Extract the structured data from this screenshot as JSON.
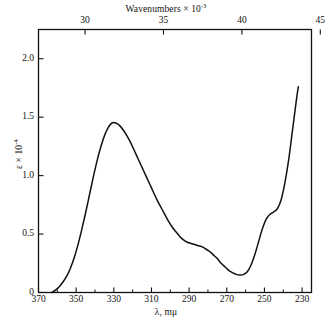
{
  "chart_data": {
    "type": "line",
    "title": "",
    "xlabel": "λ, mμ",
    "ylabel": "ε × 10",
    "ylabel_exp": "-4",
    "top_xlabel": "Wavenumbers × 10",
    "top_xlabel_exp": "-3",
    "xlim": [
      370,
      225
    ],
    "ylim": [
      0,
      2.25
    ],
    "top_xlim": [
      27.03,
      44.44
    ],
    "x_ticks": [
      370,
      350,
      330,
      310,
      290,
      270,
      250,
      230
    ],
    "x_tick_labels": [
      "370",
      "350",
      "330",
      "310",
      "290",
      "270",
      "250",
      "230"
    ],
    "x_minor_ticks": [
      360,
      340,
      320,
      300,
      280,
      260,
      240
    ],
    "y_ticks": [
      0,
      0.5,
      1.0,
      1.5,
      2.0
    ],
    "y_tick_labels": [
      "0",
      "0.5",
      "1.0",
      "1.5",
      "2.0"
    ],
    "top_x_ticks": [
      30,
      35,
      40,
      45
    ],
    "top_x_tick_labels": [
      "30",
      "35",
      "40",
      "45"
    ],
    "grid": false,
    "legend": false,
    "line_color": "#111111",
    "frame_color": "#111111",
    "series": [
      {
        "name": "absorption spectrum",
        "x": [
          363,
          361,
          359,
          357,
          355,
          353,
          351,
          349,
          347,
          345,
          343,
          341,
          339,
          337,
          335,
          333,
          331,
          329,
          327,
          325,
          323,
          321,
          319,
          317,
          315,
          313,
          311,
          309,
          307,
          305,
          303,
          301,
          299,
          297,
          295,
          293,
          291,
          289,
          287,
          285,
          283,
          281,
          279,
          277,
          275,
          273,
          271,
          269,
          267,
          265,
          263,
          261,
          259,
          257,
          255,
          253,
          251,
          249,
          247,
          245,
          243,
          241,
          239,
          237,
          235,
          233,
          232
        ],
        "y": [
          0.0,
          0.02,
          0.05,
          0.09,
          0.14,
          0.21,
          0.3,
          0.41,
          0.54,
          0.68,
          0.83,
          0.98,
          1.12,
          1.24,
          1.34,
          1.41,
          1.45,
          1.45,
          1.43,
          1.39,
          1.34,
          1.28,
          1.21,
          1.14,
          1.07,
          1.0,
          0.93,
          0.86,
          0.79,
          0.73,
          0.67,
          0.61,
          0.56,
          0.52,
          0.48,
          0.45,
          0.43,
          0.42,
          0.41,
          0.4,
          0.39,
          0.37,
          0.35,
          0.32,
          0.29,
          0.25,
          0.22,
          0.19,
          0.17,
          0.155,
          0.15,
          0.155,
          0.18,
          0.24,
          0.33,
          0.44,
          0.55,
          0.63,
          0.67,
          0.69,
          0.72,
          0.8,
          0.95,
          1.15,
          1.4,
          1.65,
          1.76
        ]
      }
    ],
    "annotations": {
      "peak_lambda": 330,
      "peak_epsilon": 1.45,
      "shoulder_lambda": 287,
      "shoulder_epsilon": 0.41,
      "minimum_lambda": 263,
      "minimum_epsilon": 0.15,
      "inflection_lambda": 245,
      "inflection_epsilon": 0.69
    }
  }
}
